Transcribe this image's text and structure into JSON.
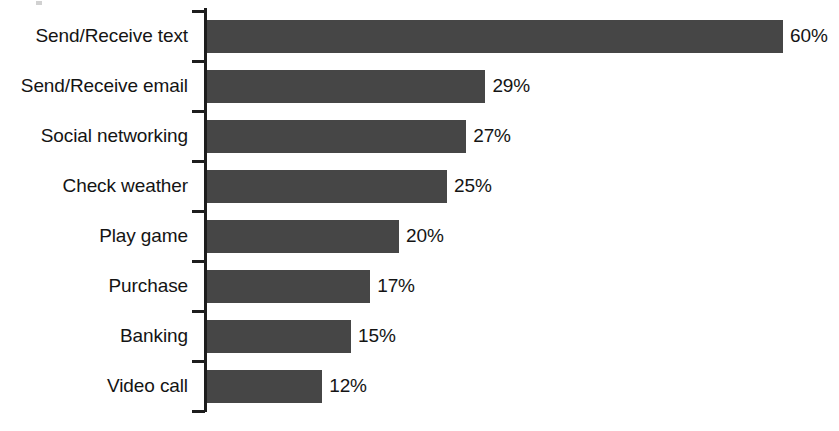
{
  "chart_data": {
    "type": "bar",
    "orientation": "horizontal",
    "title": "",
    "subtitle": "",
    "xlabel": "",
    "ylabel": "",
    "xlim": [
      0,
      60
    ],
    "grid": false,
    "legend": false,
    "value_suffix": "%",
    "categories": [
      "Send/Receive text",
      "Send/Receive email",
      "Social networking",
      "Check weather",
      "Play game",
      "Purchase",
      "Banking",
      "Video call"
    ],
    "values": [
      60,
      29,
      27,
      25,
      20,
      17,
      15,
      12
    ],
    "data_labels": [
      "60%",
      "29%",
      "27%",
      "25%",
      "20%",
      "17%",
      "15%",
      "12%"
    ],
    "bars": [
      {
        "label": "Send/Receive text",
        "value": 60,
        "display": "60%"
      },
      {
        "label": "Send/Receive email",
        "value": 29,
        "display": "29%"
      },
      {
        "label": "Social networking",
        "value": 27,
        "display": "27%"
      },
      {
        "label": "Check weather",
        "value": 25,
        "display": "25%"
      },
      {
        "label": "Play game",
        "value": 20,
        "display": "20%"
      },
      {
        "label": "Purchase",
        "value": 17,
        "display": "17%"
      },
      {
        "label": "Banking",
        "value": 15,
        "display": "15%"
      },
      {
        "label": "Video call",
        "value": 12,
        "display": "12%"
      }
    ],
    "colors": {
      "bar": "#464646",
      "axis": "#1d1d1d",
      "text": "#141414",
      "background": "#ffffff"
    }
  }
}
